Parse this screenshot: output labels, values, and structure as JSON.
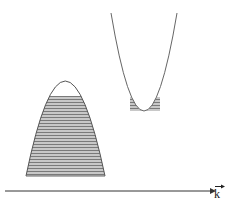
{
  "diagram": {
    "type": "band-structure",
    "axis": {
      "label": "k",
      "vector": true,
      "color": "#333333"
    },
    "valence_band": {
      "shape": "inverted-parabola",
      "filled": true,
      "fill_style": "horizontal-hatch",
      "fill_color": "#888888"
    },
    "conduction_band": {
      "shape": "parabola",
      "filled_bottom": true,
      "fill_style": "horizontal-hatch",
      "fill_color": "#999999"
    },
    "line_color": "#555555"
  }
}
